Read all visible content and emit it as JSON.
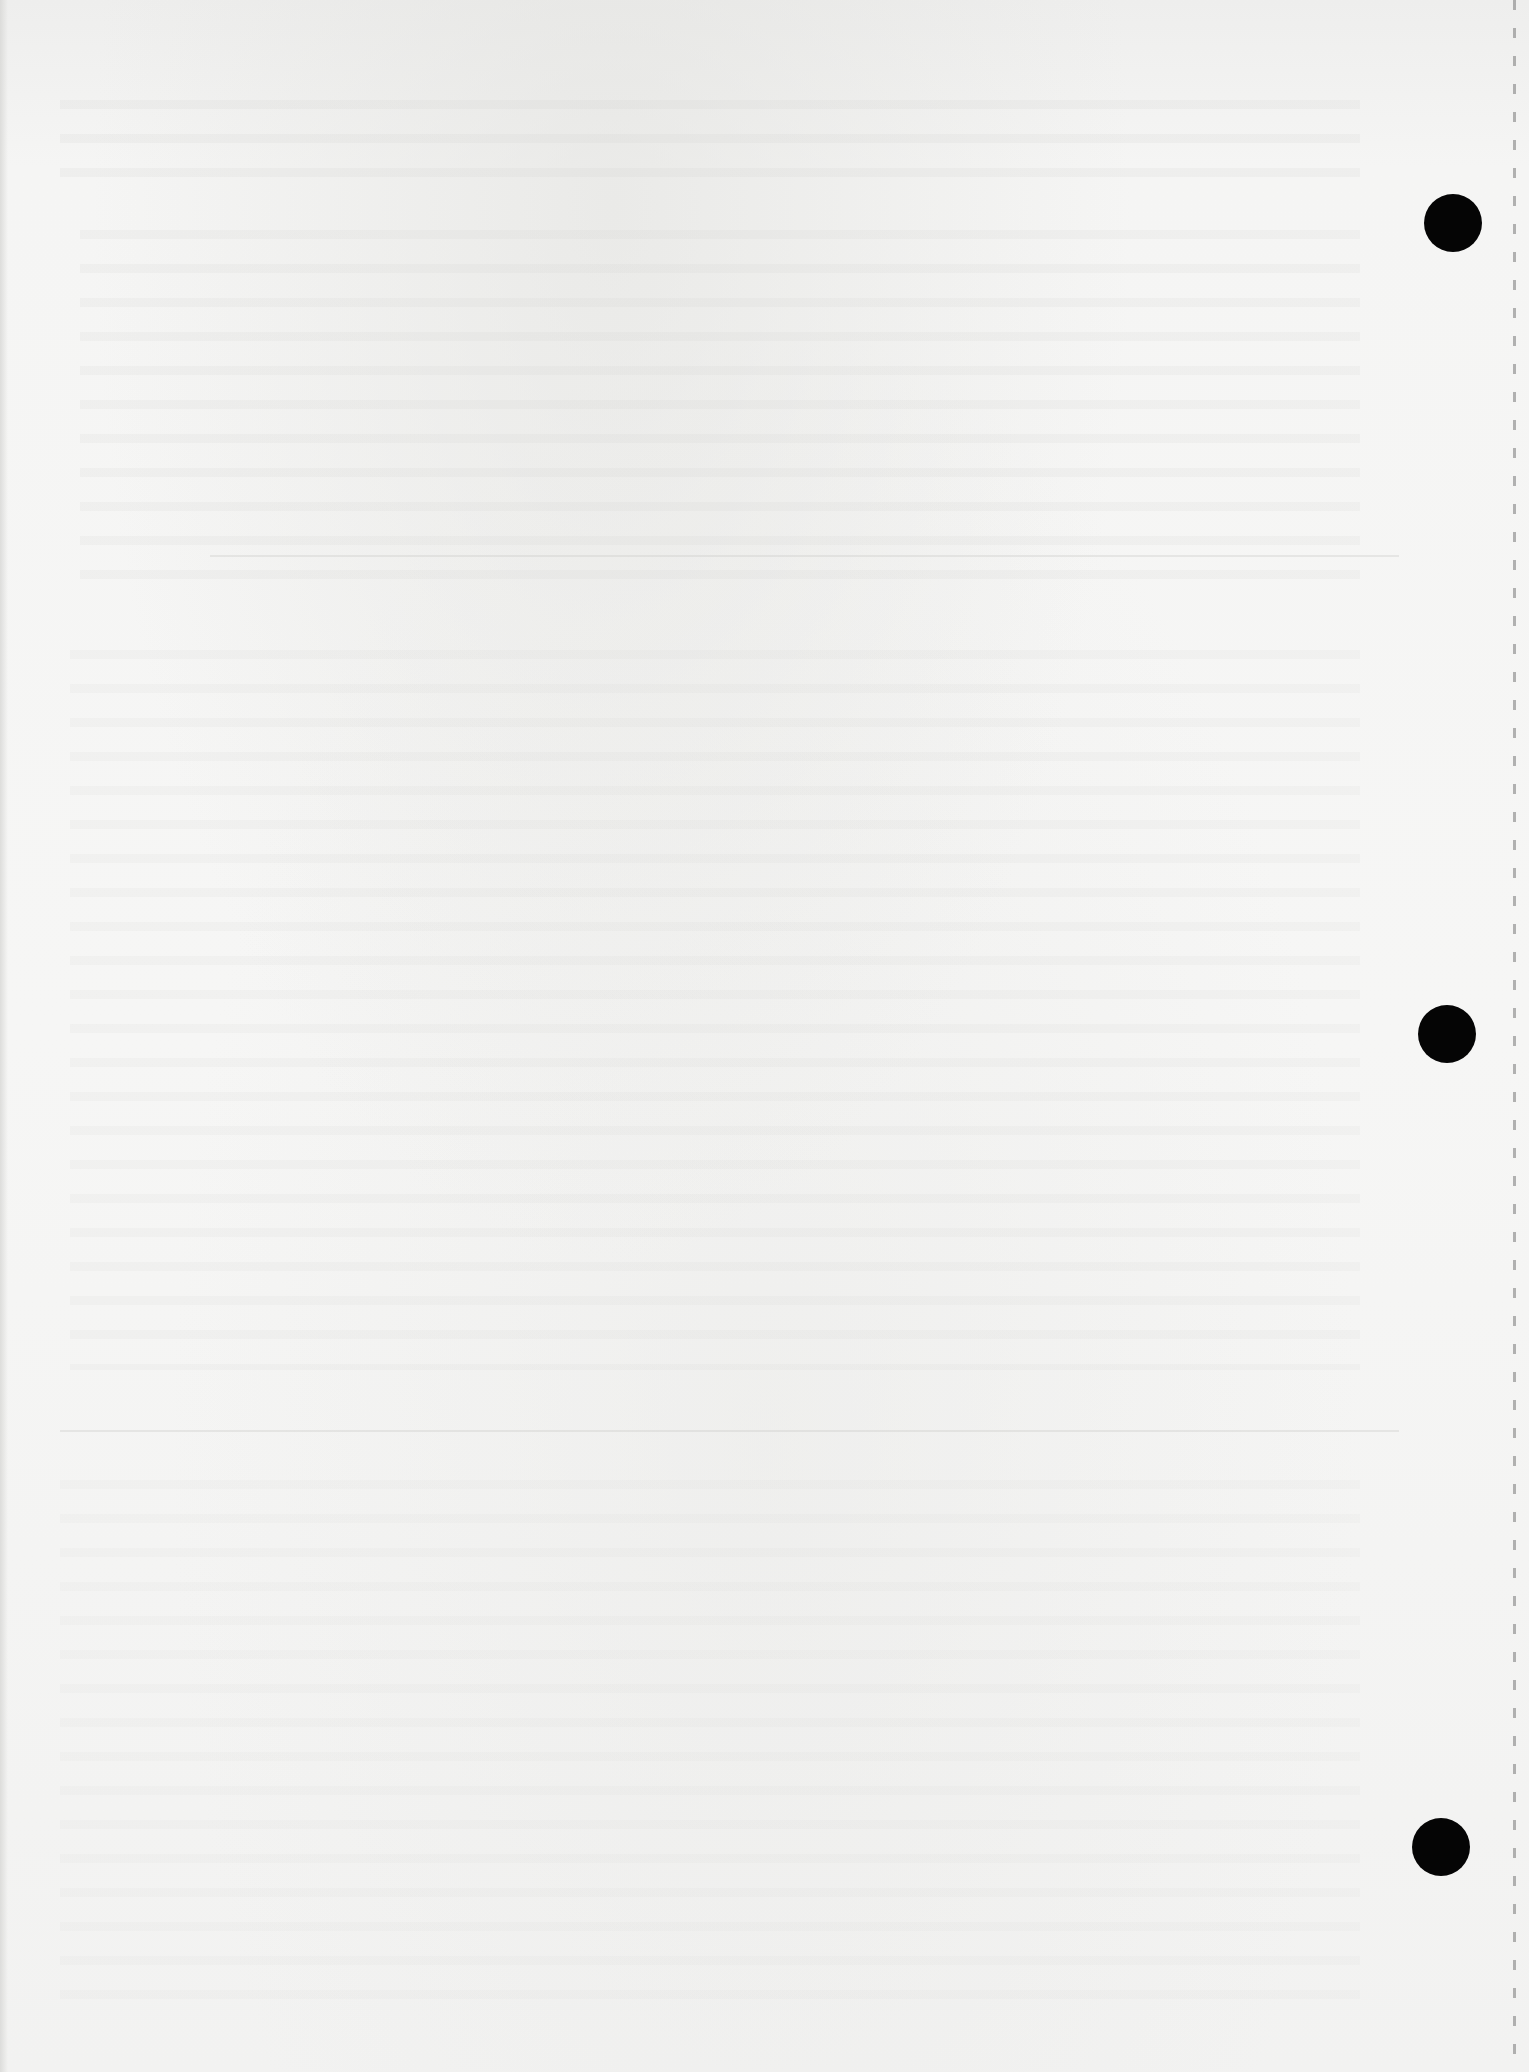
{
  "document": {
    "type": "scanned-blank-page",
    "background_color": "#f3f3f2",
    "foreground_text": [],
    "bleed_through": "illegible mirrored text from reverse side"
  },
  "punch_holes": [
    {
      "name": "punch-hole-top",
      "x": 1424,
      "y": 194,
      "diameter": 58,
      "color": "#050505"
    },
    {
      "name": "punch-hole-middle",
      "x": 1418,
      "y": 1005,
      "diameter": 58,
      "color": "#050505"
    },
    {
      "name": "punch-hole-bottom",
      "x": 1412,
      "y": 1818,
      "diameter": 58,
      "color": "#050505"
    }
  ],
  "perforation": {
    "x": 1513,
    "style": "dashed",
    "color": "#787878"
  }
}
